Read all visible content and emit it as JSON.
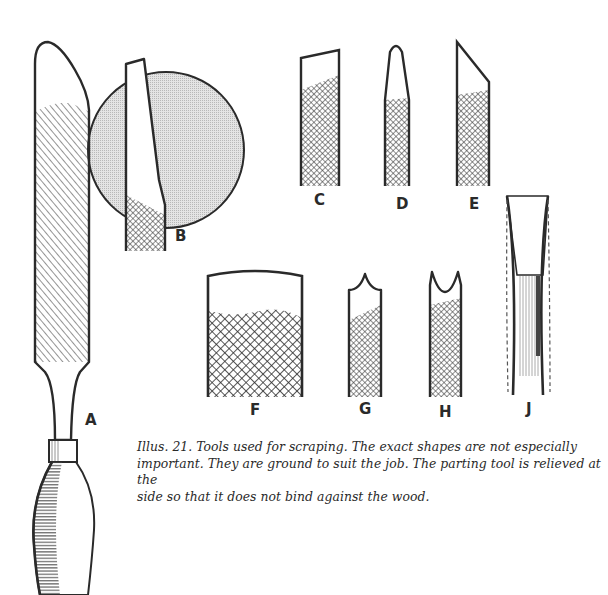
{
  "figure": {
    "labels": {
      "A": "A",
      "B": "B",
      "C": "C",
      "D": "D",
      "E": "E",
      "F": "F",
      "G": "G",
      "H": "H",
      "J": "J"
    },
    "caption": {
      "line1": "Illus. 21. Tools used for scraping. The exact shapes are not especially",
      "line2": "important. They are ground to suit the job. The parting tool is relieved at the",
      "line3": "side so that it does not bind against the wood."
    },
    "tools": [
      {
        "id": "A",
        "description": "long scraper with rounded end, wooden handle and ferrule"
      },
      {
        "id": "B",
        "description": "skew-ended scraper shown against circular shaded background"
      },
      {
        "id": "C",
        "description": "square-ended scraper, slightly skewed"
      },
      {
        "id": "D",
        "description": "round-nosed pointed scraper"
      },
      {
        "id": "E",
        "description": "skew scraper"
      },
      {
        "id": "F",
        "description": "wide scraper with slightly convex end"
      },
      {
        "id": "G",
        "description": "scraper with pointed bead end"
      },
      {
        "id": "H",
        "description": "scraper with concave bead-forming end"
      },
      {
        "id": "J",
        "description": "parting tool, relieved at side (dashed outline)"
      }
    ],
    "colors": {
      "ink": "#2a2a2a",
      "circle_fill": "#d9d9d9",
      "paper": "#ffffff"
    }
  }
}
